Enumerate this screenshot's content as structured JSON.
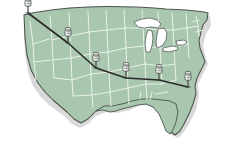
{
  "graphic": {
    "title": "United States route map",
    "type": "map",
    "region_label": "Continental United States",
    "background_color": "#ffffff"
  },
  "map": {
    "land_fill": "#a9c6ae",
    "land_fill_shade": "#9cbba3",
    "state_border_color": "#e8f2e9",
    "country_outline_color": "#4a544c",
    "lake_fill": "#ffffff",
    "lake_outline_color": "#5c665e",
    "shadow_color": "#cfcfcf",
    "lakes_label": "Great Lakes"
  },
  "route": {
    "line_color": "#2a2a2a",
    "line_width": 1.6,
    "label": "travel-route",
    "stops": [
      {
        "id": "stop-1",
        "name": "Pacific Northwest",
        "x": 28,
        "y": 13
      },
      {
        "id": "stop-2",
        "name": "Northern Rockies",
        "x": 68,
        "y": 43
      },
      {
        "id": "stop-3",
        "name": "Central Plains",
        "x": 96,
        "y": 68
      },
      {
        "id": "stop-4",
        "name": "Lower Midwest",
        "x": 126,
        "y": 78
      },
      {
        "id": "stop-5",
        "name": "Mid South",
        "x": 159,
        "y": 80
      },
      {
        "id": "stop-6",
        "name": "Southeast Coast",
        "x": 188,
        "y": 87
      }
    ]
  },
  "pin": {
    "icon_name": "map-pushpin-icon",
    "head_color": "#e6e8e6",
    "body_color": "#c7cbc7",
    "outline_color": "#4f554f",
    "needle_color": "#3a3f3a",
    "count": 6
  }
}
